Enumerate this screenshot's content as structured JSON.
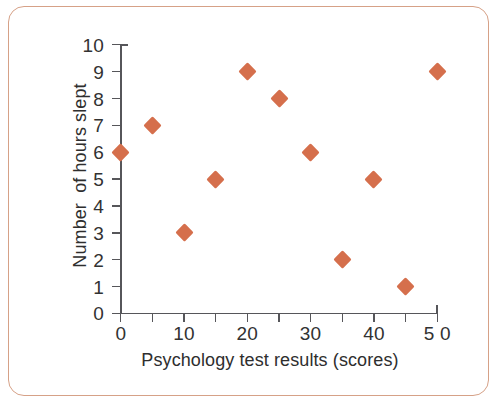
{
  "frame": {
    "border_color": "#d6a187",
    "background": "#ffffff"
  },
  "chart_data": {
    "type": "scatter",
    "title": "",
    "xlabel": "Psychology test results (scores)",
    "ylabel": "Number  of hours slept",
    "xlim": [
      0,
      50
    ],
    "ylim": [
      0,
      10
    ],
    "grid": false,
    "legend": null,
    "marker": "diamond",
    "marker_color": "#d56f4c",
    "axis_color": "#56565a",
    "x_tick_values": [
      0,
      5,
      10,
      15,
      20,
      25,
      30,
      35,
      40,
      45,
      50
    ],
    "x_tick_labels": [
      "0",
      "",
      "10",
      "",
      "20",
      "",
      "30",
      "",
      "40",
      "",
      "5 0"
    ],
    "y_tick_values": [
      0,
      1,
      2,
      3,
      4,
      5,
      6,
      7,
      8,
      9,
      10
    ],
    "y_tick_labels": [
      "0",
      "1",
      "2",
      "3",
      "4",
      "5",
      "6",
      "7",
      "8",
      "9",
      "10"
    ],
    "points": [
      {
        "x": 0,
        "y": 6
      },
      {
        "x": 5,
        "y": 7
      },
      {
        "x": 10,
        "y": 3
      },
      {
        "x": 15,
        "y": 5
      },
      {
        "x": 20,
        "y": 9
      },
      {
        "x": 25,
        "y": 8
      },
      {
        "x": 30,
        "y": 6
      },
      {
        "x": 35,
        "y": 2
      },
      {
        "x": 40,
        "y": 5
      },
      {
        "x": 45,
        "y": 1
      },
      {
        "x": 50,
        "y": 9
      }
    ]
  }
}
